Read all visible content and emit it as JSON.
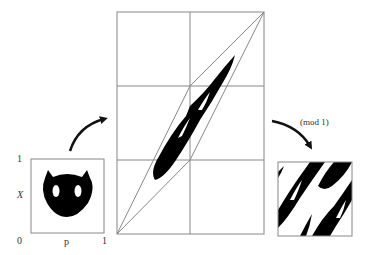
{
  "diagram": {
    "left_panel": {
      "axis_x_label": "p",
      "axis_y_label": "X",
      "tick_origin": "0",
      "tick_x_max": "1",
      "tick_y_max": "1",
      "content": "cat-face image in unit square"
    },
    "middle_panel": {
      "content": "linearly transformed cat image inside parallelogram on 2x3 grid"
    },
    "right_panel": {
      "annotation": "(mod 1)",
      "content": "image wrapped back into unit square"
    },
    "colors": {
      "ink": "#000000",
      "line": "#888888",
      "background": "#ffffff"
    }
  }
}
